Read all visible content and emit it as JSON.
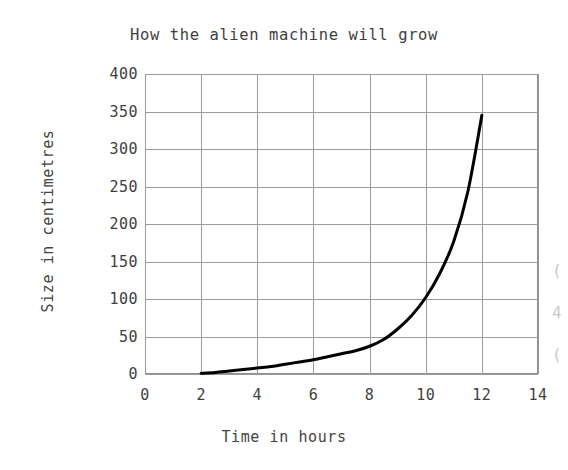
{
  "chart_data": {
    "type": "line",
    "title": "How the alien machine will grow",
    "xlabel": "Time in hours",
    "ylabel": "Size in centimetres",
    "xlim": [
      0,
      14
    ],
    "ylim": [
      0,
      400
    ],
    "xticks": [
      0,
      2,
      4,
      6,
      8,
      10,
      12,
      14
    ],
    "yticks": [
      0,
      50,
      100,
      150,
      200,
      250,
      300,
      350,
      400
    ],
    "xtick_labels": [
      "0",
      "2",
      "4",
      "6",
      "8",
      "10",
      "12",
      "14"
    ],
    "ytick_labels": [
      "0",
      "50",
      "100",
      "150",
      "200",
      "250",
      "300",
      "350",
      "400"
    ],
    "grid": true,
    "legend": null,
    "line_color": "#000000",
    "line_width": 3,
    "series": [
      {
        "name": "Size of alien machine",
        "x": [
          2.0,
          2.5,
          3.0,
          3.5,
          4.0,
          4.5,
          5.0,
          5.5,
          6.0,
          6.5,
          7.0,
          7.5,
          8.0,
          8.5,
          9.0,
          9.5,
          10.0,
          10.5,
          11.0,
          11.5,
          12.0
        ],
        "y": [
          1,
          2,
          4,
          6,
          8,
          10,
          13,
          16,
          19,
          23,
          27,
          31,
          37,
          46,
          60,
          78,
          102,
          134,
          177,
          243,
          345
        ]
      }
    ]
  },
  "axes": {
    "y_title": "Size in centimetres",
    "x_title": "Time in hours"
  },
  "margin_fragments": [
    "(",
    "4",
    "("
  ]
}
